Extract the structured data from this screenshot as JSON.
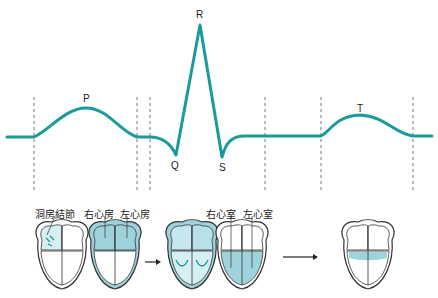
{
  "ecg": {
    "labels": {
      "p": "P",
      "q": "Q",
      "r": "R",
      "s": "S",
      "t": "T"
    },
    "wave_color": "#1a9a9a"
  },
  "heart_labels": {
    "sa_node": "洞房結節",
    "right_atrium": "右心房",
    "left_atrium": "左心房",
    "right_ventricle": "右心室",
    "left_ventricle": "左心室"
  },
  "colors": {
    "fill": "#9fd3dc",
    "outline": "#333333",
    "arrow": "#222222"
  }
}
